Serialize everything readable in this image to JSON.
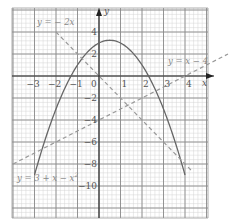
{
  "chart_data": {
    "type": "line",
    "title": "",
    "xlabel": "x",
    "ylabel": "y",
    "xlim": [
      -4,
      5
    ],
    "ylim": [
      -12,
      6
    ],
    "grid": true,
    "x_ticks": [
      -3,
      -2,
      -1,
      1,
      2,
      3,
      4
    ],
    "y_ticks": [
      4,
      2,
      -2,
      -4,
      -6,
      -8,
      -10
    ],
    "origin_label": "0",
    "series": [
      {
        "name": "y = 3 + x − x²",
        "style": "solid",
        "color": "#666666",
        "x_range": [
          -3,
          4
        ],
        "x": [
          -3,
          -2.5,
          -2,
          -1.5,
          -1,
          -0.5,
          0,
          0.5,
          1,
          1.5,
          2,
          2.5,
          3,
          3.5,
          4
        ],
        "values": [
          -9,
          -5.75,
          -3,
          -0.75,
          1,
          2.25,
          3,
          3.25,
          3,
          2.25,
          1,
          -0.75,
          -3,
          -5.75,
          -9
        ]
      },
      {
        "name": "y = −2x",
        "style": "dashed",
        "color": "#999999",
        "x": [
          -2,
          4.3
        ],
        "values": [
          4,
          -8.6
        ]
      },
      {
        "name": "y = x − 4",
        "style": "dashed",
        "color": "#999999",
        "x": [
          -4,
          6
        ],
        "values": [
          -8,
          2
        ]
      }
    ],
    "annotations": [
      {
        "text": "y = −2x",
        "near": [
          -2,
          5
        ]
      },
      {
        "text": "y = x − 4",
        "near": [
          4,
          1.7
        ]
      },
      {
        "text": "y = 3 + x − x²",
        "near": [
          -3.5,
          -9.5
        ]
      }
    ]
  },
  "labels": {
    "x_axis": "x",
    "y_axis": "y",
    "origin": "0",
    "eq_neg2x": "y = − 2x",
    "eq_xminus4": "y = x − 4",
    "eq_parabola": "y = 3 + x − x",
    "eq_parabola_sup": "2",
    "xt": [
      "−3",
      "−2",
      "−1",
      "1",
      "2",
      "3",
      "4"
    ],
    "yt": [
      "4",
      "2",
      "−2",
      "−4",
      "−6",
      "−8",
      "−10"
    ]
  }
}
